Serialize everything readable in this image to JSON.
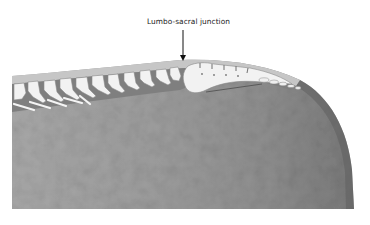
{
  "figure": {
    "annotation": {
      "label": "Lumbo-sacral junction",
      "pointer": "arrow-down"
    },
    "colors": {
      "background": "#ffffff",
      "body": "#9a9a9a",
      "body_dark": "#6e6e6e",
      "topline": "#c4c4c4",
      "bone": "#f2f2f2",
      "bone_outline": "#8a8a8a",
      "text": "#222222"
    }
  }
}
